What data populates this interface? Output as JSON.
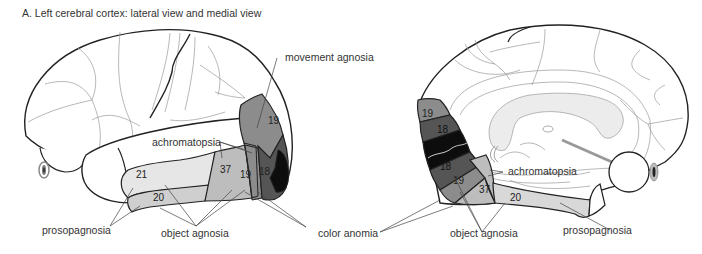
{
  "figure": {
    "title": "A. Left cerebral cortex: lateral view and medial view",
    "views": [
      "lateral view",
      "medial view"
    ]
  },
  "lateral": {
    "areas": [
      {
        "id": "21",
        "label": "21"
      },
      {
        "id": "20",
        "label": "20"
      },
      {
        "id": "37",
        "label": "37"
      },
      {
        "id": "19a",
        "label": "19"
      },
      {
        "id": "19b",
        "label": "19"
      },
      {
        "id": "18",
        "label": "18"
      }
    ],
    "labels": {
      "movement_agnosia": "movement agnosia",
      "achromatopsia": "achromatopsia",
      "prosopagnosia": "prosopagnosia",
      "object_agnosia": "object agnosia"
    }
  },
  "medial": {
    "areas": [
      {
        "id": "19a",
        "label": "19"
      },
      {
        "id": "18a",
        "label": "18"
      },
      {
        "id": "18b",
        "label": "18"
      },
      {
        "id": "19b",
        "label": "19"
      },
      {
        "id": "37",
        "label": "37"
      },
      {
        "id": "20",
        "label": "20"
      }
    ],
    "labels": {
      "achromatopsia": "achromatopsia",
      "object_agnosia": "object agnosia",
      "prosopagnosia": "prosopagnosia"
    }
  },
  "shared_labels": {
    "color_anomia": "color anomia"
  },
  "colors": {
    "area_20_21": "#e6e6e6",
    "area_20_dark": "#cfcfcf",
    "area_37": "#bdbdbd",
    "area_19": "#8c8c8c",
    "area_18": "#555555",
    "area_17": "#0d0d0d",
    "limbic": "#ececec",
    "outline": "#222222",
    "sulcus": "#999999"
  }
}
